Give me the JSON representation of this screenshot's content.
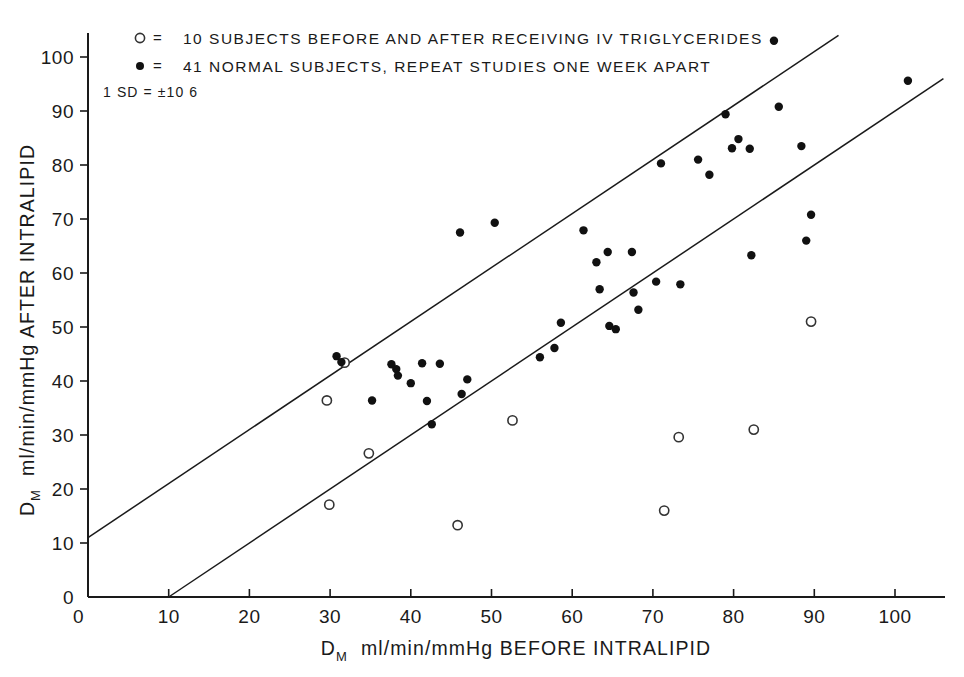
{
  "chart_data": {
    "type": "scatter",
    "title": "",
    "xlabel": "D_M  ml/min/mmHg  BEFORE INTRALIPID",
    "ylabel": "D_M  ml/min/mmHg AFTER INTRALIPID",
    "xlabel_parts": {
      "prefix": "D",
      "sub": "M",
      "rest": "ml/min/mmHg  BEFORE INTRALIPID"
    },
    "ylabel_parts": {
      "prefix": "D",
      "sub": "M",
      "rest": "ml/min/mmHg AFTER INTRALIPID"
    },
    "xlim": [
      0,
      106
    ],
    "ylim": [
      0,
      104
    ],
    "xticks": [
      0,
      10,
      20,
      30,
      40,
      50,
      60,
      70,
      80,
      90,
      100
    ],
    "xtick_labels": [
      "0",
      "10",
      "20",
      "30",
      "40",
      "50",
      "60",
      "70",
      "80",
      "90",
      "100"
    ],
    "yticks": [
      0,
      10,
      20,
      30,
      40,
      50,
      60,
      70,
      80,
      90,
      100
    ],
    "ytick_labels": [
      "0",
      "10",
      "20",
      "30",
      "40",
      "50",
      "60",
      "70",
      "80",
      "90",
      "100"
    ],
    "grid": false,
    "legend_position": "top-left",
    "legend": [
      {
        "marker": "open-circle",
        "symbol": "○",
        "equals": "=",
        "label": "10 SUBJECTS BEFORE AND AFTER RECEIVING IV TRIGLYCERIDES"
      },
      {
        "marker": "filled-circle",
        "symbol": "●",
        "equals": "=",
        "label": "41 NORMAL SUBJECTS, REPEAT STUDIES ONE WEEK APART"
      }
    ],
    "annotations": [
      {
        "name": "sd-annotation",
        "text": "1 SD = ±10 6",
        "x": 5,
        "y": 93
      }
    ],
    "reference_lines": [
      {
        "name": "upper-identity-plus-sd",
        "equation": "y = x + 11",
        "x0": 0,
        "y0": 11,
        "x1": 93,
        "y1": 104
      },
      {
        "name": "lower-identity-minus-sd",
        "equation": "y = x - 10",
        "x0": 10,
        "y0": 0,
        "x1": 106,
        "y1": 96
      }
    ],
    "series": [
      {
        "name": "41 NORMAL SUBJECTS, REPEAT STUDIES ONE WEEK APART",
        "marker": "filled-circle",
        "color": "#111111",
        "points": [
          [
            30.8,
            44.6
          ],
          [
            31.4,
            43.5
          ],
          [
            35.2,
            36.4
          ],
          [
            37.6,
            43.1
          ],
          [
            38.2,
            42.2
          ],
          [
            38.4,
            41.0
          ],
          [
            40.0,
            39.6
          ],
          [
            41.4,
            43.3
          ],
          [
            42.0,
            36.3
          ],
          [
            42.6,
            32.0
          ],
          [
            43.6,
            43.2
          ],
          [
            46.1,
            67.5
          ],
          [
            46.3,
            37.6
          ],
          [
            47.0,
            40.3
          ],
          [
            50.4,
            69.3
          ],
          [
            56.0,
            44.4
          ],
          [
            57.8,
            46.1
          ],
          [
            58.6,
            50.8
          ],
          [
            61.4,
            67.9
          ],
          [
            63.0,
            62.0
          ],
          [
            63.4,
            57.0
          ],
          [
            64.4,
            63.9
          ],
          [
            64.6,
            50.2
          ],
          [
            65.4,
            49.6
          ],
          [
            67.4,
            63.9
          ],
          [
            67.6,
            56.4
          ],
          [
            68.2,
            53.2
          ],
          [
            70.4,
            58.4
          ],
          [
            71.0,
            80.3
          ],
          [
            73.4,
            57.9
          ],
          [
            75.6,
            81.0
          ],
          [
            77.0,
            78.2
          ],
          [
            79.0,
            89.4
          ],
          [
            79.8,
            83.1
          ],
          [
            80.6,
            84.8
          ],
          [
            82.0,
            83.0
          ],
          [
            82.2,
            63.3
          ],
          [
            85.0,
            103.0
          ],
          [
            85.6,
            90.8
          ],
          [
            88.4,
            83.5
          ],
          [
            89.0,
            66.0
          ],
          [
            89.6,
            70.8
          ],
          [
            101.6,
            95.6
          ]
        ]
      },
      {
        "name": "10 SUBJECTS BEFORE AND AFTER RECEIVING IV TRIGLYCERIDES",
        "marker": "open-circle",
        "color": "#ffffff",
        "edge_color": "#333333",
        "points": [
          [
            29.6,
            36.4
          ],
          [
            31.8,
            43.4
          ],
          [
            29.9,
            17.1
          ],
          [
            34.8,
            26.6
          ],
          [
            45.8,
            13.3
          ],
          [
            52.6,
            32.7
          ],
          [
            71.4,
            16.0
          ],
          [
            73.2,
            29.6
          ],
          [
            82.5,
            31.0
          ],
          [
            89.6,
            51.0
          ]
        ]
      }
    ]
  }
}
